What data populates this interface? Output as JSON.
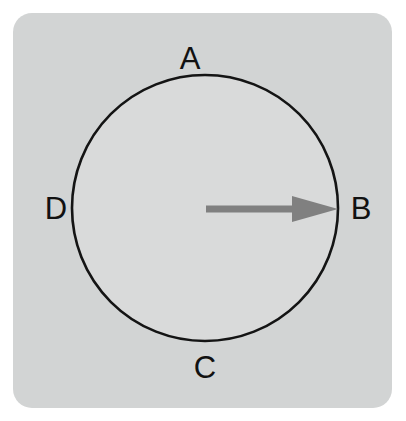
{
  "figure": {
    "name": "circle-with-radius-arrow",
    "canvas": {
      "width": 406,
      "height": 421,
      "background": "#ffffff"
    },
    "panel": {
      "fill": "#d2d4d4",
      "corner_radius": 19,
      "x": 13,
      "y": 13,
      "width": 379,
      "height": 395
    },
    "circle": {
      "center_x": 205,
      "center_y": 208,
      "radius": 133,
      "stroke": "#141414",
      "stroke_width": 2.6,
      "fill": "#d9dada"
    },
    "arrow": {
      "color": "#808080",
      "direction": "right",
      "start_x": 206,
      "start_y": 209,
      "end_x": 338,
      "end_y": 209,
      "shaft_thickness": 7,
      "head_length": 46,
      "head_width": 26,
      "description": "radius arrow from center to point B"
    },
    "labels": [
      {
        "id": "A",
        "text": "A",
        "position": "top",
        "x": 190,
        "y": 58
      },
      {
        "id": "B",
        "text": "B",
        "position": "right",
        "x": 361,
        "y": 208
      },
      {
        "id": "C",
        "text": "C",
        "position": "bottom",
        "x": 205,
        "y": 367
      },
      {
        "id": "D",
        "text": "D",
        "position": "left",
        "x": 56,
        "y": 208
      }
    ],
    "text_color": "#111111",
    "label_font_size": 31
  }
}
